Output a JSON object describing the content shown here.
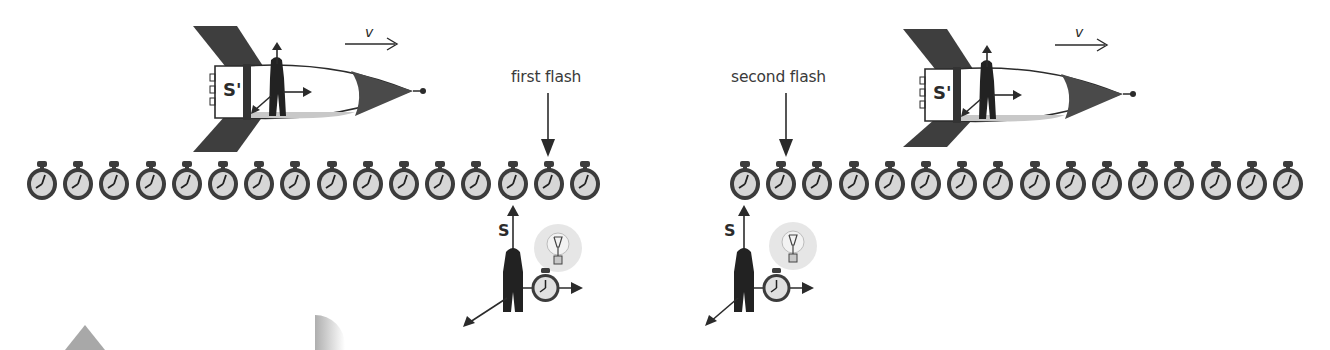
{
  "figure": {
    "panels": [
      {
        "id": "left",
        "flash_label": "first flash",
        "ship_frame_label": "S'",
        "velocity_label": "v",
        "ground_frame_label": "S",
        "clock_count": 16
      },
      {
        "id": "right",
        "flash_label": "second flash",
        "ship_frame_label": "S'",
        "velocity_label": "v",
        "ground_frame_label": "S",
        "clock_count": 16
      }
    ]
  },
  "colors": {
    "ink": "#2b2b2b",
    "clock_rim": "#3c3c3c",
    "clock_face": "#d6d6d6",
    "nose": "#4a4a4a",
    "floor": "#c8c8c8",
    "bulb_glow": "#dcdcdc"
  }
}
